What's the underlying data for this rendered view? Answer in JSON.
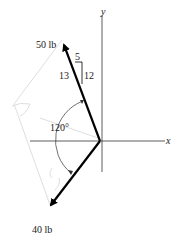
{
  "diagram": {
    "axes": {
      "x_label": "x",
      "y_label": "y"
    },
    "forces": [
      {
        "label": "50 lb",
        "magnitude": 50,
        "unit": "lb",
        "slope": {
          "hyp": "13",
          "horizontal": "5",
          "vertical": "12"
        }
      },
      {
        "label": "40 lb",
        "magnitude": 40,
        "unit": "lb"
      }
    ],
    "angle_label": "120°",
    "colors": {
      "vector": "#000000",
      "axis": "#333333",
      "ghost": "#d0d0d0"
    }
  }
}
